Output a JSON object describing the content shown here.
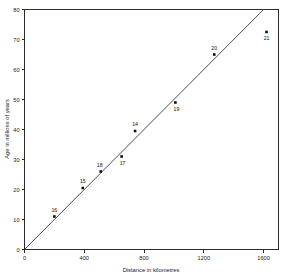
{
  "chart_data": {
    "type": "scatter",
    "title": "",
    "xlabel": "Distance in kilometres",
    "ylabel": "Age in millions of years",
    "xlim": [
      0,
      1700
    ],
    "ylim": [
      0,
      80
    ],
    "xticks": [
      0,
      400,
      800,
      1200,
      1600
    ],
    "yticks": [
      0,
      10,
      20,
      30,
      40,
      50,
      60,
      70,
      80
    ],
    "xtick_labels": [
      "0",
      "400",
      "800",
      "1200",
      "1600"
    ],
    "ytick_labels": [
      "0",
      "10",
      "20",
      "30",
      "40",
      "50",
      "60",
      "70",
      "80"
    ],
    "grid": false,
    "legend": null,
    "points": [
      {
        "label": "16",
        "x": 200,
        "y": 11.0,
        "label_dx": 0,
        "label_dy": -5
      },
      {
        "label": "15",
        "x": 390,
        "y": 20.5,
        "label_dx": 0,
        "label_dy": -5
      },
      {
        "label": "18",
        "x": 510,
        "y": 26.0,
        "label_dx": -1,
        "label_dy": -5
      },
      {
        "label": "17",
        "x": 650,
        "y": 31.0,
        "label_dx": 1,
        "label_dy": 8
      },
      {
        "label": "14",
        "x": 740,
        "y": 39.5,
        "label_dx": 0,
        "label_dy": -5
      },
      {
        "label": "19",
        "x": 1010,
        "y": 49.0,
        "label_dx": 1,
        "label_dy": 8
      },
      {
        "label": "20",
        "x": 1270,
        "y": 65.0,
        "label_dx": 0,
        "label_dy": -5
      },
      {
        "label": "21",
        "x": 1620,
        "y": 72.5,
        "label_dx": 0,
        "label_dy": 8
      }
    ],
    "fit_line": {
      "description": "straight line of best fit through the origin",
      "x_start": 0,
      "y_start": 0,
      "x_end": 1600,
      "y_end": 80,
      "slope": 0.05,
      "intercept": 0
    },
    "marker_style": "filled-square",
    "marker_color": "#101010",
    "line_color": "#3a3a3a",
    "axis_color": "#2b2b2b",
    "background_color": "#ffffff"
  }
}
